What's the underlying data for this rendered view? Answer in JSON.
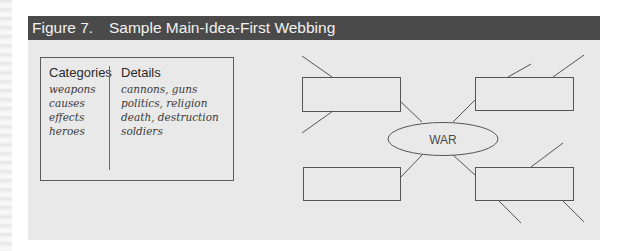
{
  "figure": {
    "number": "Figure 7.",
    "title": "Sample Main-Idea-First Webbing"
  },
  "list_box": {
    "categories_header": "Categories",
    "details_header": "Details",
    "rows": [
      {
        "category": "weapons",
        "detail": "cannons, guns"
      },
      {
        "category": "causes",
        "detail": "politics, religion"
      },
      {
        "category": "effects",
        "detail": "death, destruction"
      },
      {
        "category": "heroes",
        "detail": "soldiers"
      }
    ]
  },
  "web": {
    "center_label": "WAR",
    "boxes": [
      {
        "position": "top-left",
        "text": ""
      },
      {
        "position": "top-right",
        "text": ""
      },
      {
        "position": "bottom-left",
        "text": ""
      },
      {
        "position": "bottom-right",
        "text": ""
      }
    ]
  },
  "colors": {
    "header_bg": "#4a4a4a",
    "panel_bg": "#e9e9e9",
    "line": "#555555"
  }
}
